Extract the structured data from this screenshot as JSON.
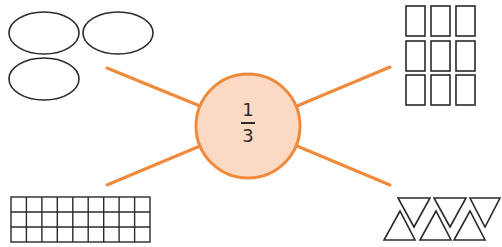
{
  "diagram": {
    "center": {
      "numerator": "1",
      "denominator": "3",
      "fill": "#fcd9c3",
      "stroke": "#ef8a3c"
    },
    "spoke_color": "#ef8a3c",
    "outline_color": "#2a2a2a",
    "groups": [
      {
        "name": "ovals",
        "shape": "ellipse",
        "count": 3
      },
      {
        "name": "rectangles",
        "shape": "rectangle",
        "count": 9,
        "rows": 3,
        "cols": 3
      },
      {
        "name": "grid",
        "shape": "square",
        "count": 27,
        "rows": 3,
        "cols": 9
      },
      {
        "name": "triangles",
        "shape": "triangle",
        "count": 6
      }
    ]
  }
}
